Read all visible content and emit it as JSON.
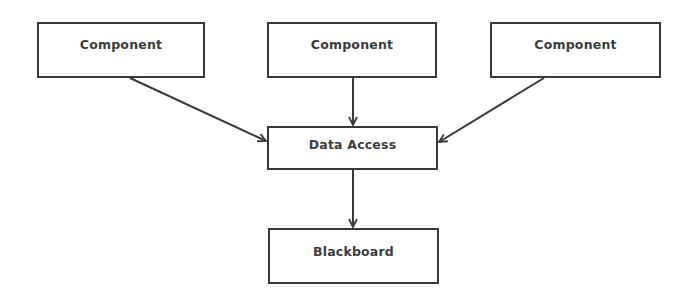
{
  "diagram": {
    "nodes": [
      {
        "id": "component-1",
        "label": "Component"
      },
      {
        "id": "component-2",
        "label": "Component"
      },
      {
        "id": "component-3",
        "label": "Component"
      },
      {
        "id": "data-access",
        "label": "Data Access"
      },
      {
        "id": "blackboard",
        "label": "Blackboard"
      }
    ],
    "edges": [
      {
        "from": "component-1",
        "to": "data-access"
      },
      {
        "from": "component-2",
        "to": "data-access"
      },
      {
        "from": "component-3",
        "to": "data-access"
      },
      {
        "from": "data-access",
        "to": "blackboard"
      }
    ],
    "colors": {
      "stroke": "#3a3a3a",
      "text": "#3c3c3c",
      "background": "#ffffff"
    }
  }
}
